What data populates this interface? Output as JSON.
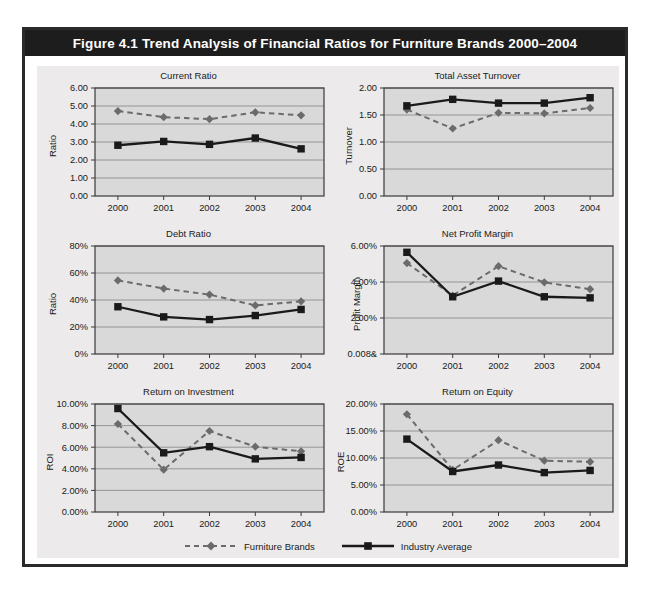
{
  "figure": {
    "title": "Figure 4.1  Trend Analysis of Financial Ratios for Furniture Brands 2000–2004"
  },
  "legend": {
    "entries": [
      {
        "label": "Furniture Brands",
        "style": "dashed-diamond",
        "color": "#6b6b6b"
      },
      {
        "label": "Industry Average",
        "style": "solid-square",
        "color": "#1a1a1a"
      }
    ]
  },
  "colors": {
    "frame": "#2a2a2a",
    "title_bar": "#1d1d1d",
    "panel_bg": "#eceaea",
    "plot_bg": "#d9d9d9",
    "furniture_brands": "#6b6b6b",
    "industry_average": "#1a1a1a",
    "gridline": "#8d8d8d",
    "axis": "#3a3a3a"
  },
  "chart_data": [
    {
      "id": "current-ratio",
      "type": "line",
      "title": "Current Ratio",
      "xlabel": "",
      "ylabel": "Ratio",
      "categories": [
        "2000",
        "2001",
        "2002",
        "2003",
        "2004"
      ],
      "yticks": [
        "0.00",
        "1.00",
        "2.00",
        "3.00",
        "4.00",
        "5.00",
        "6.00"
      ],
      "ylim": [
        0,
        6
      ],
      "grid": true,
      "legend_position": "figure-bottom",
      "series": [
        {
          "name": "Furniture Brands",
          "values": [
            4.72,
            4.38,
            4.27,
            4.65,
            4.48
          ]
        },
        {
          "name": "Industry Average",
          "values": [
            2.82,
            3.03,
            2.87,
            3.22,
            2.62
          ]
        }
      ]
    },
    {
      "id": "total-asset-turnover",
      "type": "line",
      "title": "Total Asset Turnover",
      "xlabel": "",
      "ylabel": "Turnover",
      "categories": [
        "2000",
        "2001",
        "2002",
        "2003",
        "2004"
      ],
      "yticks": [
        "0.00",
        "0.50",
        "1.00",
        "1.50",
        "2.00"
      ],
      "ylim": [
        0,
        2
      ],
      "grid": true,
      "legend_position": "figure-bottom",
      "series": [
        {
          "name": "Furniture Brands",
          "values": [
            1.6,
            1.25,
            1.54,
            1.53,
            1.63
          ]
        },
        {
          "name": "Industry Average",
          "values": [
            1.67,
            1.79,
            1.72,
            1.72,
            1.82
          ]
        }
      ]
    },
    {
      "id": "debt-ratio",
      "type": "line",
      "title": "Debt Ratio",
      "xlabel": "",
      "ylabel": "Ratio",
      "categories": [
        "2000",
        "2001",
        "2002",
        "2003",
        "2004"
      ],
      "yticks": [
        "0%",
        "20%",
        "40%",
        "60%",
        "80%"
      ],
      "ylim": [
        0,
        80
      ],
      "grid": true,
      "legend_position": "figure-bottom",
      "series": [
        {
          "name": "Furniture Brands",
          "values": [
            54.5,
            48.5,
            44.0,
            36.0,
            39.0
          ]
        },
        {
          "name": "Industry Average",
          "values": [
            35.0,
            27.5,
            25.5,
            28.5,
            33.0
          ]
        }
      ]
    },
    {
      "id": "net-profit-margin",
      "type": "line",
      "title": "Net Profit Margin",
      "xlabel": "",
      "ylabel": "Profit Margin",
      "categories": [
        "2000",
        "2001",
        "2002",
        "2003",
        "2004"
      ],
      "yticks": [
        "0.008&",
        "2.00%",
        "4.00%",
        "6.00%"
      ],
      "ylim": [
        0,
        6
      ],
      "grid": true,
      "legend_position": "figure-bottom",
      "series": [
        {
          "name": "Furniture Brands",
          "values": [
            5.05,
            3.25,
            4.88,
            3.98,
            3.6
          ]
        },
        {
          "name": "Industry Average",
          "values": [
            5.65,
            3.18,
            4.05,
            3.18,
            3.12
          ]
        }
      ]
    },
    {
      "id": "return-on-investment",
      "type": "line",
      "title": "Return on Investment",
      "xlabel": "",
      "ylabel": "ROI",
      "categories": [
        "2000",
        "2001",
        "2002",
        "2003",
        "2004"
      ],
      "yticks": [
        "0.00%",
        "2.00%",
        "4.00%",
        "6.00%",
        "8.00%",
        "10.00%"
      ],
      "ylim": [
        0,
        10
      ],
      "grid": true,
      "legend_position": "figure-bottom",
      "series": [
        {
          "name": "Furniture Brands",
          "values": [
            8.15,
            3.92,
            7.5,
            6.05,
            5.62
          ]
        },
        {
          "name": "Industry Average",
          "values": [
            9.58,
            5.48,
            6.05,
            4.92,
            5.05
          ]
        }
      ]
    },
    {
      "id": "return-on-equity",
      "type": "line",
      "title": "Return on Equity",
      "xlabel": "",
      "ylabel": "ROE",
      "categories": [
        "2000",
        "2001",
        "2002",
        "2003",
        "2004"
      ],
      "yticks": [
        "0.00%",
        "5.00%",
        "10.00%",
        "15.00%",
        "20.00%"
      ],
      "ylim": [
        0,
        20
      ],
      "grid": true,
      "legend_position": "figure-bottom",
      "series": [
        {
          "name": "Furniture Brands",
          "values": [
            18.1,
            7.8,
            13.3,
            9.5,
            9.3
          ]
        },
        {
          "name": "Industry Average",
          "values": [
            13.5,
            7.5,
            8.7,
            7.3,
            7.7
          ]
        }
      ]
    }
  ]
}
